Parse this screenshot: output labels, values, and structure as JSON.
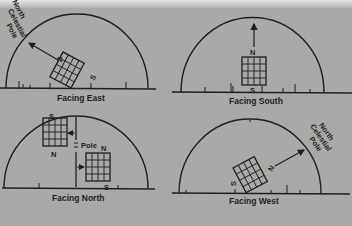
{
  "figure": {
    "panels": [
      {
        "id": "east",
        "caption": "Facing East",
        "pole_label": [
          "North",
          "Celestial",
          "Pole"
        ],
        "grid_top_label": "N",
        "grid_bottom_label": "S",
        "grid": {
          "rows": 4,
          "cols": 4
        }
      },
      {
        "id": "south",
        "caption": "Facing South",
        "grid_top_label": "N",
        "grid_bottom_label": "S",
        "grid": {
          "rows": 4,
          "cols": 4
        }
      },
      {
        "id": "north",
        "caption": "Facing North",
        "pole_label": "Pole",
        "upper_grid_top_label": "S",
        "upper_grid_bottom_label": "N",
        "lower_grid_top_label": "N",
        "lower_grid_bottom_label": "S",
        "grid": {
          "rows": 4,
          "cols": 4
        }
      },
      {
        "id": "west",
        "caption": "Facing West",
        "pole_label": [
          "North",
          "Celestial",
          "Pole"
        ],
        "grid_top_label": "N",
        "grid_bottom_label": "S",
        "grid": {
          "rows": 4,
          "cols": 4
        }
      }
    ]
  },
  "colors": {
    "background": "#a9a9a7",
    "ink": "#1e1e1e"
  }
}
